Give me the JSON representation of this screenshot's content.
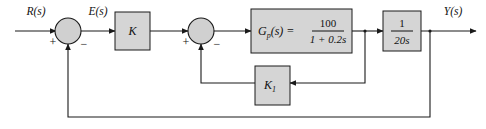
{
  "diagram": {
    "type": "control-system-block-diagram",
    "signals": {
      "input_label": "R(s)",
      "error_label": "E(s)",
      "output_label": "Y(s)"
    },
    "blocks": [
      {
        "id": "gain-k",
        "label": "K",
        "kind": "gain"
      },
      {
        "id": "plant-gp",
        "label": "G",
        "label_sub": "p",
        "label_rest": "(s) =",
        "numerator": "100",
        "denominator": "1 + 0.2s",
        "kind": "transfer-function"
      },
      {
        "id": "integrator",
        "numerator": "1",
        "denominator": "20s",
        "kind": "transfer-function"
      },
      {
        "id": "feedback-k1",
        "label": "K",
        "label_sub": "1",
        "kind": "gain"
      }
    ],
    "summing_junctions": [
      {
        "id": "outer-summer",
        "positive_sign": "+",
        "negative_sign": "−"
      },
      {
        "id": "inner-summer",
        "positive_sign": "+",
        "negative_sign": "−"
      }
    ],
    "colors": {
      "block_fill": "#d5d5d5",
      "junction_fill": "#d0d0d0",
      "line": "#1a1a1a",
      "background": "#ffffff"
    }
  }
}
